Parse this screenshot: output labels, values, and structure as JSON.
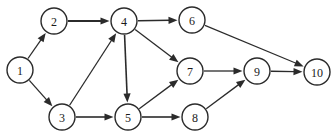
{
  "diagram": {
    "type": "directed-graph",
    "background_color": "#ffffff",
    "node_fill_color": "#ffffff",
    "node_stroke_color": "#2b2b2b",
    "edge_color": "#2b2b2b",
    "label_color": "#1a1a1a",
    "node_radius": 13,
    "nodes": [
      {
        "id": "1",
        "label": "1",
        "cx": 20,
        "cy": 70
      },
      {
        "id": "2",
        "label": "2",
        "cx": 54,
        "cy": 21
      },
      {
        "id": "3",
        "label": "3",
        "cx": 62,
        "cy": 117
      },
      {
        "id": "4",
        "label": "4",
        "cx": 124,
        "cy": 21
      },
      {
        "id": "5",
        "label": "5",
        "cx": 128,
        "cy": 117
      },
      {
        "id": "6",
        "label": "6",
        "cx": 192,
        "cy": 20
      },
      {
        "id": "7",
        "label": "7",
        "cx": 190,
        "cy": 71
      },
      {
        "id": "8",
        "label": "8",
        "cx": 195,
        "cy": 117
      },
      {
        "id": "9",
        "label": "9",
        "cx": 257,
        "cy": 71
      },
      {
        "id": "10",
        "label": "10",
        "cx": 317,
        "cy": 72
      }
    ],
    "edges": [
      {
        "from": "1",
        "to": "2",
        "width": 1.3
      },
      {
        "from": "1",
        "to": "3",
        "width": 1.3
      },
      {
        "from": "2",
        "to": "4",
        "width": 2.0
      },
      {
        "from": "3",
        "to": "4",
        "width": 1.3
      },
      {
        "from": "3",
        "to": "5",
        "width": 1.6
      },
      {
        "from": "4",
        "to": "5",
        "width": 1.6
      },
      {
        "from": "4",
        "to": "6",
        "width": 1.6
      },
      {
        "from": "4",
        "to": "7",
        "width": 1.3
      },
      {
        "from": "5",
        "to": "7",
        "width": 1.3
      },
      {
        "from": "5",
        "to": "8",
        "width": 1.6
      },
      {
        "from": "6",
        "to": "10",
        "width": 1.1
      },
      {
        "from": "7",
        "to": "9",
        "width": 1.3
      },
      {
        "from": "8",
        "to": "9",
        "width": 1.3
      },
      {
        "from": "9",
        "to": "10",
        "width": 1.4
      }
    ]
  }
}
